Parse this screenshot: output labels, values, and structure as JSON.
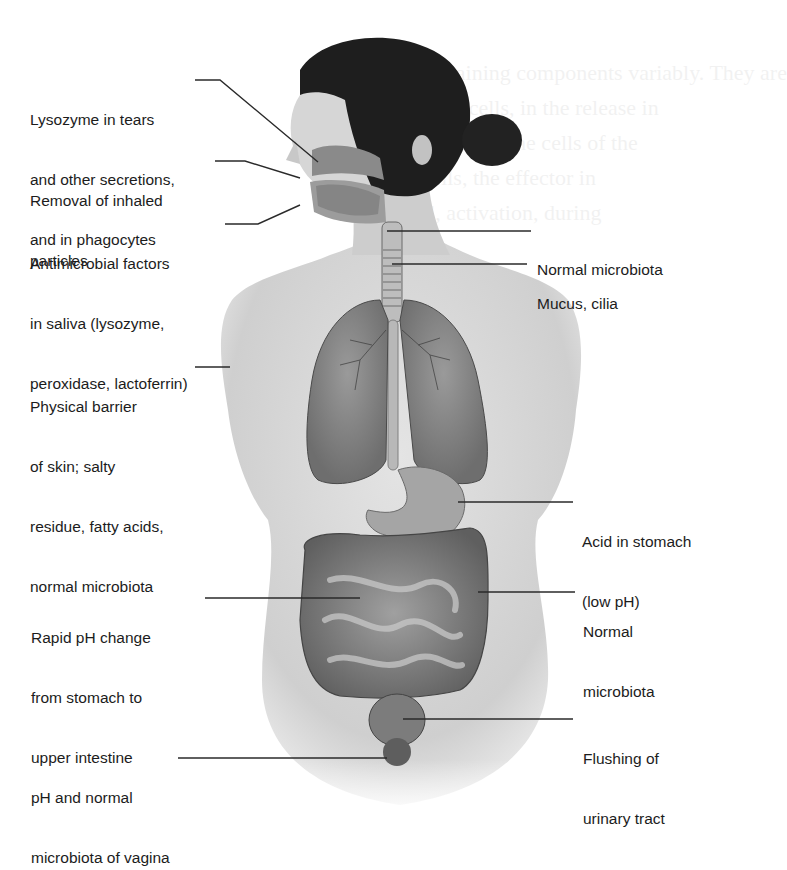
{
  "figure": {
    "colors": {
      "ink": "#1c1c1c",
      "leader": "#2a2a2a",
      "skin": "#d9d9d9",
      "skin_shadow": "#a9a9a9",
      "hair": "#1e1e1e",
      "organ": "#8c8c8c",
      "organ_dark": "#5a5a5a",
      "background": "#ffffff"
    }
  },
  "labels": {
    "left": [
      {
        "id": "lysozyme",
        "lines": [
          "Lysozyme in tears",
          "and other secretions,",
          "and in phagocytes"
        ]
      },
      {
        "id": "inhaled",
        "lines": [
          "Removal of inhaled",
          "particles"
        ]
      },
      {
        "id": "saliva",
        "lines": [
          "Antimicrobial factors",
          "in saliva (lysozyme,",
          "peroxidase, lactoferrin)"
        ]
      },
      {
        "id": "skin",
        "lines": [
          "Physical barrier",
          "of skin; salty",
          "residue, fatty acids,",
          "normal microbiota"
        ]
      },
      {
        "id": "ph-change",
        "lines": [
          "Rapid pH change",
          "from stomach to",
          "upper intestine"
        ]
      },
      {
        "id": "vagina",
        "lines": [
          "pH and normal",
          "microbiota of vagina"
        ]
      }
    ],
    "right": [
      {
        "id": "microbiota-throat",
        "lines": [
          "Normal microbiota"
        ]
      },
      {
        "id": "mucus",
        "lines": [
          "Mucus, cilia"
        ]
      },
      {
        "id": "stomach",
        "lines": [
          "Acid in stomach",
          "(low pH)"
        ]
      },
      {
        "id": "microbiota-intestine",
        "lines": [
          "Normal",
          "microbiota"
        ]
      },
      {
        "id": "urinary",
        "lines": [
          "Flushing of",
          "urinary tract"
        ]
      }
    ]
  }
}
